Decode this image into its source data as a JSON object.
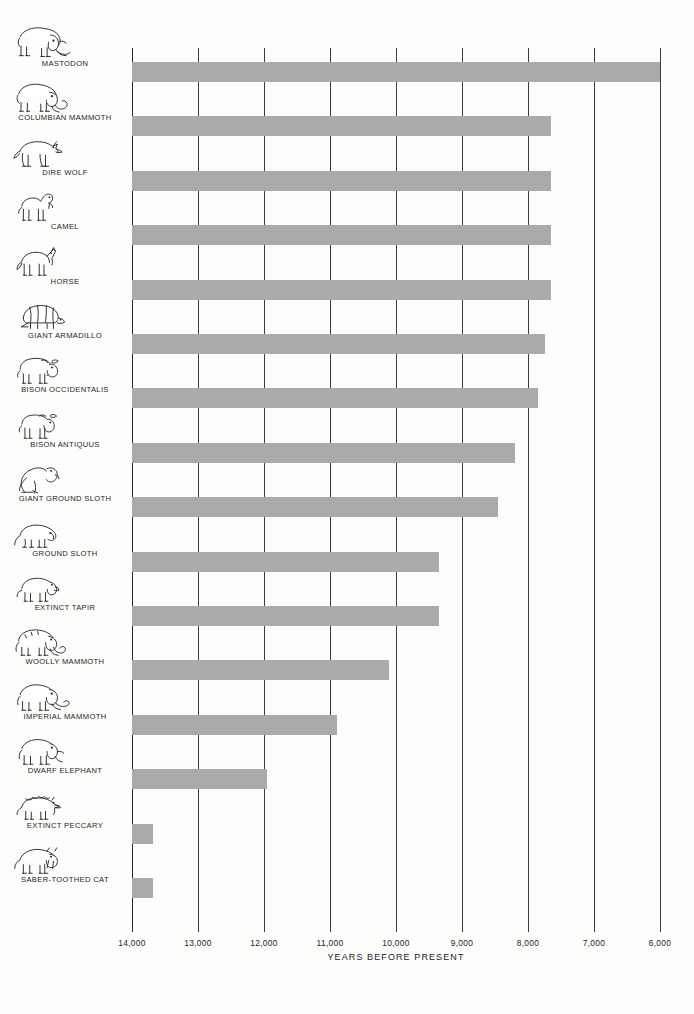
{
  "chart_data": {
    "type": "bar",
    "orientation": "horizontal",
    "title": "",
    "xlabel": "YEARS BEFORE PRESENT",
    "ylabel": "",
    "xlim": [
      14000,
      6000
    ],
    "x_axis_reversed": true,
    "xticks": [
      14000,
      13000,
      12000,
      11000,
      10000,
      9000,
      8000,
      7000,
      6000
    ],
    "xtick_labels": [
      "14,000",
      "13,000",
      "12,000",
      "11,000",
      "10,000",
      "9,000",
      "8,000",
      "7,000",
      "6,000"
    ],
    "grid": true,
    "legend": "none",
    "bar_color": "#aaaaaa",
    "bar_start": 14000,
    "categories": [
      "MASTODON",
      "COLUMBIAN MAMMOTH",
      "DIRE WOLF",
      "CAMEL",
      "HORSE",
      "GIANT ARMADILLO",
      "BISON OCCIDENTALIS",
      "BISON ANTIQUUS",
      "GIANT GROUND SLOTH",
      "GROUND SLOTH",
      "EXTINCT TAPIR",
      "WOOLLY MAMMOTH",
      "IMPERIAL MAMMOTH",
      "DWARF ELEPHANT",
      "EXTINCT PECCARY",
      "SABER-TOOTHED CAT"
    ],
    "values": [
      6000,
      7650,
      7650,
      7650,
      7650,
      7750,
      7850,
      8200,
      8450,
      9350,
      9350,
      10100,
      10900,
      11950,
      13680,
      13680
    ],
    "icons": [
      "mastodon-icon",
      "columbian-mammoth-icon",
      "dire-wolf-icon",
      "camel-icon",
      "horse-icon",
      "giant-armadillo-icon",
      "bison-occidentalis-icon",
      "bison-antiquus-icon",
      "giant-ground-sloth-icon",
      "ground-sloth-icon",
      "extinct-tapir-icon",
      "woolly-mammoth-icon",
      "imperial-mammoth-icon",
      "dwarf-elephant-icon",
      "extinct-peccary-icon",
      "saber-toothed-cat-icon"
    ]
  }
}
